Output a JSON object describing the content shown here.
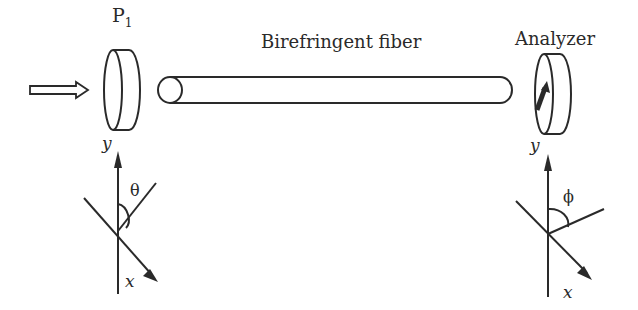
{
  "labels": {
    "polarizer": "P",
    "polarizer_subscript": "1",
    "fiber": "Birefringent fiber",
    "analyzer": "Analyzer",
    "left_y_axis": "y",
    "left_x_axis": "x",
    "right_y_axis": "y",
    "right_x_axis": "x",
    "theta": "θ",
    "phi": "ϕ",
    "left_disk_y": "y",
    "right_disk_y": "y"
  },
  "colors": {
    "stroke": "#2a2a2a",
    "background": "#ffffff"
  }
}
